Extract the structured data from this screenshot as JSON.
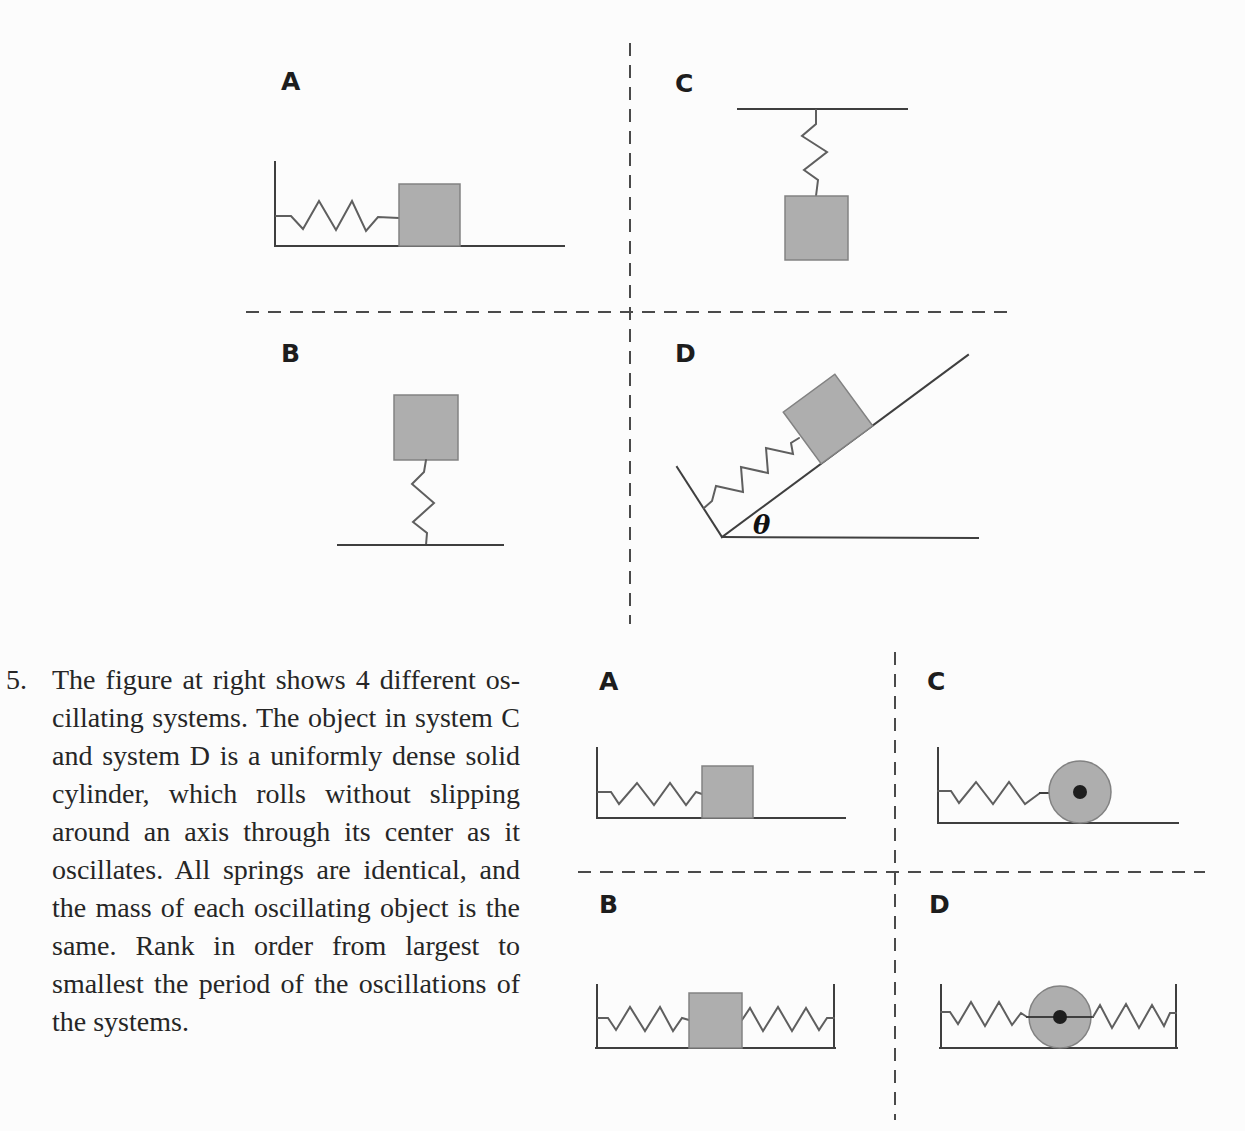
{
  "problem": {
    "number": "5.",
    "lines": [
      "The figure at right shows 4 different os-",
      "cillating systems. The object in system C",
      "and system D is a uniformly dense solid",
      "cylinder, which rolls without slipping",
      "around an axis through its center as it",
      "oscillates. All springs are identical, and",
      "the mass of each oscillating object is the",
      "same. Rank in order from largest to",
      "smallest the period of the oscillations of",
      "the systems."
    ]
  },
  "figure_top": {
    "labels": {
      "a": "A",
      "b": "B",
      "c": "C",
      "d": "D"
    },
    "angle_label": "θ"
  },
  "figure_bottom": {
    "labels": {
      "a": "A",
      "b": "B",
      "c": "C",
      "d": "D"
    }
  },
  "colors": {
    "background": "#fcfcfc",
    "line": "#3f3f3f",
    "dash": "#4a4a4a",
    "spring": "#5f5f5f",
    "block_fill": "#aeaeae",
    "block_stroke": "#828282",
    "axle_dot": "#1e1e1e",
    "text": "#262626"
  }
}
